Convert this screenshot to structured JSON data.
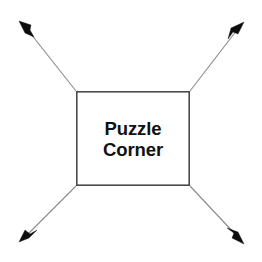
{
  "canvas": {
    "width": 262,
    "height": 262,
    "background_color": "#ffffff"
  },
  "diagram": {
    "type": "radiating-arrows",
    "center_box": {
      "label_line1": "Puzzle",
      "label_line2": "Corner",
      "x": 76,
      "y": 91,
      "width": 114,
      "height": 95,
      "fill_color": "#ffffff",
      "border_color": "#4a4a4a",
      "border_width": 1.6,
      "text_color": "#111111"
    },
    "arrows": [
      {
        "name": "arrow-top-left",
        "direction": "up-left",
        "from_x": 76,
        "from_y": 91,
        "to_x": 22,
        "to_y": 24,
        "line_color": "#8a8a8a",
        "head_color": "#0d0d0d"
      },
      {
        "name": "arrow-top-right",
        "direction": "up-right",
        "from_x": 190,
        "from_y": 91,
        "to_x": 241,
        "to_y": 25,
        "line_color": "#8a8a8a",
        "head_color": "#0d0d0d"
      },
      {
        "name": "arrow-bottom-left",
        "direction": "down-left",
        "from_x": 76,
        "from_y": 186,
        "to_x": 23,
        "to_y": 239,
        "line_color": "#8a8a8a",
        "head_color": "#0d0d0d"
      },
      {
        "name": "arrow-bottom-right",
        "direction": "down-right",
        "from_x": 190,
        "from_y": 186,
        "to_x": 241,
        "to_y": 242,
        "line_color": "#8a8a8a",
        "head_color": "#0d0d0d"
      }
    ]
  }
}
